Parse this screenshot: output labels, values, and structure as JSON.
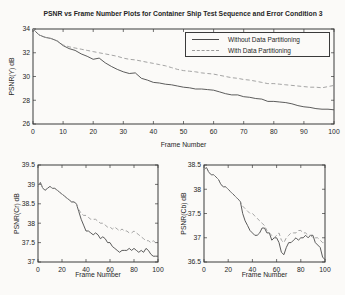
{
  "figure": {
    "background": "#fbfaf8",
    "axis_color": "#3a3a3a"
  },
  "legend": {
    "position": "top-right-inside",
    "entries": [
      {
        "label": "Without Data Partitioning",
        "style": "solid",
        "color": "#4a4a4a"
      },
      {
        "label": "With Data Partitioning",
        "style": "dashed",
        "color": "#9a9a9a"
      }
    ]
  },
  "chart_data": [
    {
      "type": "line",
      "title": "PSNR vs Frame Number Plots for Container Ship Test Sequence and Error Condition 3",
      "xlabel": "Frame Number",
      "ylabel": "PSNR(Y) dB",
      "xlim": [
        0,
        100
      ],
      "ylim": [
        26,
        34
      ],
      "xticks": [
        0,
        10,
        20,
        30,
        40,
        50,
        60,
        70,
        80,
        90,
        100
      ],
      "yticks": [
        26,
        28,
        30,
        32,
        34
      ],
      "grid": false,
      "x": [
        0,
        2,
        4,
        6,
        8,
        10,
        12,
        14,
        16,
        18,
        20,
        22,
        24,
        26,
        28,
        30,
        32,
        34,
        36,
        38,
        40,
        42,
        44,
        46,
        48,
        50,
        52,
        54,
        56,
        58,
        60,
        62,
        64,
        66,
        68,
        70,
        72,
        74,
        76,
        78,
        80,
        82,
        84,
        86,
        88,
        90,
        92,
        94,
        96,
        98,
        100
      ],
      "series": [
        {
          "name": "Without Data Partitioning",
          "style": "solid",
          "color": "#4a4a4a",
          "values": [
            34,
            33.5,
            33.3,
            33.2,
            33,
            32.6,
            32.35,
            32.2,
            31.9,
            31.7,
            31.45,
            31.55,
            31.15,
            30.85,
            30.6,
            30.4,
            30.25,
            30.3,
            29.85,
            29.7,
            29.5,
            29.45,
            29.35,
            29.3,
            29.2,
            29.1,
            29.05,
            28.95,
            28.95,
            28.9,
            28.85,
            28.7,
            28.55,
            28.45,
            28.45,
            28.3,
            28.25,
            28.15,
            28.1,
            27.9,
            27.9,
            27.85,
            27.8,
            27.7,
            27.55,
            27.45,
            27.4,
            27.3,
            27.25,
            27.25,
            27.2
          ]
        },
        {
          "name": "With Data Partitioning",
          "style": "dashed",
          "color": "#9a9a9a",
          "values": [
            34,
            33.5,
            33.3,
            33.2,
            33,
            32.65,
            32.5,
            32.4,
            32.3,
            32.2,
            32.1,
            32,
            31.9,
            31.8,
            31.7,
            31.55,
            31.45,
            31.4,
            31.3,
            31.2,
            31.1,
            31,
            30.9,
            30.75,
            30.6,
            30.5,
            30.45,
            30.4,
            30.3,
            30.25,
            30.2,
            30.1,
            30,
            29.9,
            29.85,
            29.75,
            29.7,
            29.6,
            29.5,
            29.4,
            29.4,
            29.35,
            29.3,
            29.25,
            29.2,
            29.15,
            29.1,
            29.1,
            29.05,
            29.15,
            29.25
          ]
        }
      ]
    },
    {
      "type": "line",
      "title": "",
      "xlabel": "Frame Number",
      "ylabel": "PSNR(Cr) dB",
      "xlim": [
        0,
        100
      ],
      "ylim": [
        37,
        39.5
      ],
      "xticks": [
        0,
        20,
        40,
        60,
        80,
        100
      ],
      "yticks": [
        37,
        37.5,
        38,
        38.5,
        39,
        39.5
      ],
      "grid": false,
      "x": [
        0,
        2,
        4,
        6,
        8,
        10,
        12,
        14,
        16,
        18,
        20,
        22,
        24,
        26,
        28,
        30,
        32,
        34,
        36,
        38,
        40,
        42,
        44,
        46,
        48,
        50,
        52,
        54,
        56,
        58,
        60,
        62,
        64,
        66,
        68,
        70,
        72,
        74,
        76,
        78,
        80,
        82,
        84,
        86,
        88,
        90,
        92,
        94,
        96,
        98,
        100
      ],
      "series": [
        {
          "name": "Without Data Partitioning",
          "style": "solid",
          "color": "#4a4a4a",
          "values": [
            38.95,
            39.05,
            38.9,
            38.85,
            38.9,
            38.95,
            38.9,
            38.9,
            38.85,
            38.8,
            38.75,
            38.7,
            38.65,
            38.6,
            38.55,
            38.55,
            38.5,
            38.3,
            38.1,
            37.95,
            37.8,
            37.8,
            37.75,
            37.7,
            37.75,
            37.7,
            37.6,
            37.65,
            37.6,
            37.5,
            37.5,
            37.4,
            37.35,
            37.3,
            37.25,
            37.3,
            37.3,
            37.3,
            37.35,
            37.3,
            37.35,
            37.3,
            37.25,
            37.3,
            37.25,
            37.35,
            37.3,
            37.2,
            37.15,
            37.15,
            37.15
          ]
        },
        {
          "name": "With Data Partitioning",
          "style": "dashed",
          "color": "#9a9a9a",
          "values": [
            38.95,
            39.05,
            38.9,
            38.85,
            38.9,
            38.95,
            38.9,
            38.9,
            38.85,
            38.8,
            38.75,
            38.7,
            38.65,
            38.6,
            38.55,
            38.55,
            38.5,
            38.35,
            38.25,
            38.2,
            38.2,
            38.15,
            38.1,
            38.1,
            38.1,
            38.05,
            38,
            38,
            37.95,
            37.9,
            37.9,
            37.85,
            37.9,
            37.85,
            37.8,
            37.85,
            37.8,
            37.8,
            37.75,
            37.75,
            37.8,
            37.75,
            37.7,
            37.65,
            37.6,
            37.55,
            37.55,
            37.5,
            37.55,
            37.5,
            37.45
          ]
        }
      ]
    },
    {
      "type": "line",
      "title": "",
      "xlabel": "Frame Number",
      "ylabel": "PSNR(Cb) dB",
      "xlim": [
        0,
        100
      ],
      "ylim": [
        36.5,
        38.5
      ],
      "xticks": [
        0,
        20,
        40,
        60,
        80,
        100
      ],
      "yticks": [
        36.5,
        37,
        37.5,
        38,
        38.5
      ],
      "grid": false,
      "x": [
        0,
        2,
        4,
        6,
        8,
        10,
        12,
        14,
        16,
        18,
        20,
        22,
        24,
        26,
        28,
        30,
        32,
        34,
        36,
        38,
        40,
        42,
        44,
        46,
        48,
        50,
        52,
        54,
        56,
        58,
        60,
        62,
        64,
        66,
        68,
        70,
        72,
        74,
        76,
        78,
        80,
        82,
        84,
        86,
        88,
        90,
        92,
        94,
        96,
        98,
        100
      ],
      "series": [
        {
          "name": "Without Data Partitioning",
          "style": "solid",
          "color": "#4a4a4a",
          "values": [
            38.4,
            38.45,
            38.35,
            38.3,
            38.3,
            38.25,
            38.2,
            38.1,
            38.05,
            38.05,
            38,
            37.95,
            37.9,
            37.85,
            37.8,
            37.75,
            37.5,
            37.35,
            37.25,
            37.15,
            37.1,
            37.05,
            37.05,
            37.1,
            37.2,
            37.2,
            37.1,
            37.1,
            36.95,
            37,
            37,
            36.9,
            36.7,
            36.65,
            36.8,
            36.9,
            36.9,
            36.95,
            37,
            36.95,
            37,
            37,
            37.05,
            37,
            37.05,
            37.05,
            36.9,
            36.85,
            36.8,
            36.6,
            36.55
          ]
        },
        {
          "name": "With Data Partitioning",
          "style": "dashed",
          "color": "#9a9a9a",
          "values": [
            38.4,
            38.45,
            38.35,
            38.3,
            38.3,
            38.25,
            38.2,
            38.1,
            38.05,
            38.05,
            38,
            37.95,
            37.9,
            37.85,
            37.8,
            37.75,
            37.65,
            37.6,
            37.55,
            37.5,
            37.5,
            37.45,
            37.4,
            37.35,
            37.3,
            37.25,
            37.15,
            37.1,
            37.05,
            37,
            37.05,
            37.1,
            36.95,
            36.9,
            37,
            37.05,
            37.1,
            37.1,
            37.1,
            37.15,
            37.15,
            37.1,
            37.1,
            37.05,
            37.05,
            37,
            37,
            37,
            36.95,
            36.9,
            36.9
          ]
        }
      ]
    }
  ]
}
